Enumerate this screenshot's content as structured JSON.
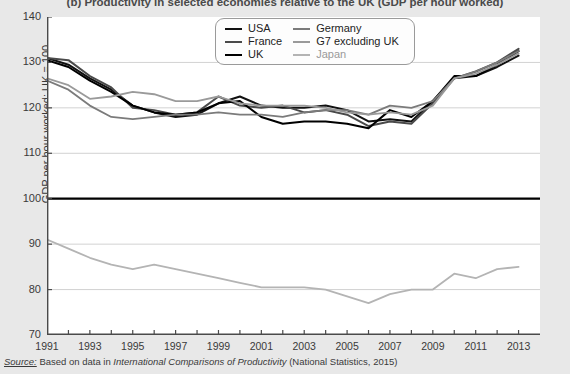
{
  "figure": {
    "label": "(b)",
    "title": "(b) Productivity in selected economies relative to the UK (GDP per hour worked)",
    "source_lead": "Source:",
    "source_text": "Based on data in",
    "source_italic": "International Comparisons of Productivity",
    "source_tail": "(National Statistics, 2015)"
  },
  "legend": {
    "entries": [
      {
        "label": "USA",
        "color": "#111111"
      },
      {
        "label": "Germany",
        "color": "#7b7b7b"
      },
      {
        "label": "France",
        "color": "#4a4a4a"
      },
      {
        "label": "G7 excluding UK",
        "color": "#9a9a9a"
      },
      {
        "label": "UK",
        "color": "#000000"
      },
      {
        "label": "Japan",
        "color": "#b4b4b4"
      }
    ]
  },
  "chart_data": {
    "type": "line",
    "title": "(b) Productivity in selected economies relative to the UK (GDP per hour worked)",
    "xlabel": "",
    "ylabel": "GDP per hour worked: UK = 100",
    "xlim": [
      1991,
      2014
    ],
    "ylim": [
      70,
      140
    ],
    "yticks": [
      70,
      80,
      90,
      100,
      110,
      120,
      130,
      140
    ],
    "xticks": [
      1991,
      1992,
      1993,
      1994,
      1995,
      1996,
      1997,
      1998,
      1999,
      2000,
      2001,
      2002,
      2003,
      2004,
      2005,
      2006,
      2007,
      2008,
      2009,
      2010,
      2011,
      2012,
      2013
    ],
    "xtick_labels": [
      "1991",
      "",
      "1993",
      "",
      "1995",
      "",
      "1997",
      "",
      "1999",
      "",
      "2001",
      "",
      "2003",
      "",
      "2005",
      "",
      "2007",
      "",
      "2009",
      "",
      "2011",
      "",
      "2013"
    ],
    "grid": "horizontal",
    "legend_position": "top-center",
    "reference_line": {
      "value": 100,
      "label": "UK = 100",
      "color": "#000000",
      "width": 2.2
    },
    "x": [
      1991,
      1992,
      1993,
      1994,
      1995,
      1996,
      1997,
      1998,
      1999,
      2000,
      2001,
      2002,
      2003,
      2004,
      2005,
      2006,
      2007,
      2008,
      2009,
      2010,
      2011,
      2012,
      2013
    ],
    "series": [
      {
        "name": "USA",
        "color": "#111111",
        "width": 2.0,
        "values": [
          131.0,
          129.5,
          126.5,
          124.0,
          120.5,
          119.0,
          118.0,
          118.5,
          121.0,
          122.5,
          120.5,
          120.0,
          120.0,
          120.5,
          119.5,
          117.0,
          117.5,
          117.0,
          121.5,
          126.5,
          127.0,
          129.0,
          131.5
        ]
      },
      {
        "name": "France",
        "color": "#4a4a4a",
        "width": 2.0,
        "values": [
          131.0,
          130.5,
          127.0,
          124.5,
          120.0,
          119.5,
          118.5,
          119.0,
          122.5,
          120.5,
          120.0,
          120.5,
          119.0,
          119.5,
          118.5,
          116.0,
          117.0,
          116.5,
          121.0,
          126.5,
          128.0,
          130.0,
          133.0
        ]
      },
      {
        "name": "UK",
        "color": "#000000",
        "width": 2.0,
        "values": [
          130.5,
          129.0,
          126.0,
          123.5,
          120.5,
          119.0,
          118.5,
          119.0,
          121.0,
          121.5,
          118.0,
          116.5,
          117.0,
          117.0,
          116.5,
          115.5,
          119.5,
          118.0,
          121.5,
          127.0,
          127.0,
          129.5,
          132.5
        ]
      },
      {
        "name": "Germany",
        "color": "#7b7b7b",
        "width": 1.8,
        "values": [
          126.0,
          124.0,
          120.5,
          118.0,
          117.5,
          118.0,
          118.5,
          118.5,
          119.0,
          118.5,
          118.5,
          118.0,
          119.0,
          119.5,
          119.5,
          118.5,
          120.5,
          120.0,
          121.5,
          126.5,
          128.0,
          130.0,
          132.5
        ]
      },
      {
        "name": "G7 excluding UK",
        "color": "#9a9a9a",
        "width": 1.8,
        "values": [
          126.5,
          125.0,
          122.0,
          122.5,
          123.5,
          123.0,
          121.5,
          121.5,
          122.5,
          121.0,
          120.5,
          120.5,
          120.5,
          120.0,
          119.0,
          118.5,
          119.0,
          118.5,
          120.5,
          126.5,
          127.5,
          129.5,
          132.0
        ]
      },
      {
        "name": "Japan",
        "color": "#b4b4b4",
        "width": 1.8,
        "values": [
          91.0,
          89.0,
          87.0,
          85.5,
          84.5,
          85.5,
          84.5,
          83.5,
          82.5,
          81.5,
          80.5,
          80.5,
          80.5,
          80.0,
          78.5,
          77.0,
          79.0,
          80.0,
          80.0,
          83.5,
          82.5,
          84.5,
          85.0
        ]
      }
    ]
  }
}
